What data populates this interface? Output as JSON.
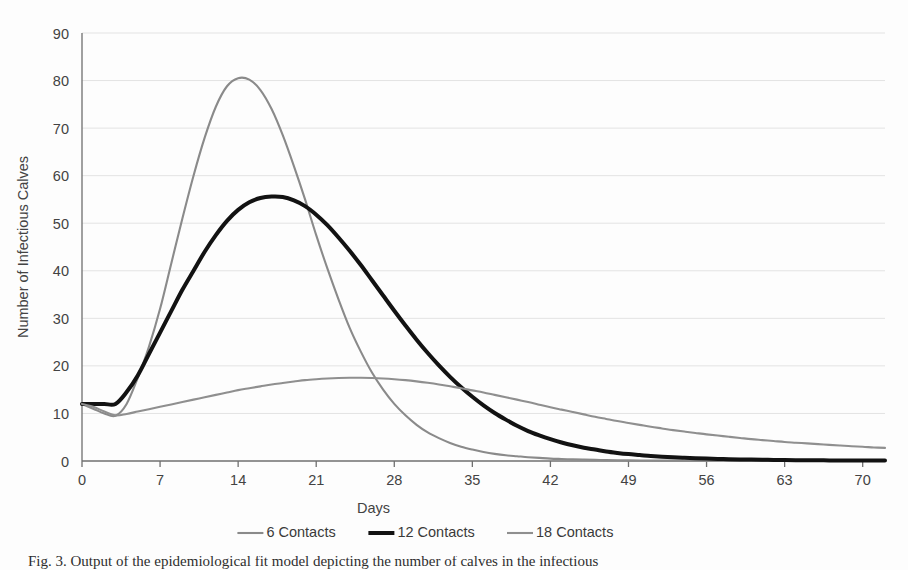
{
  "figure": {
    "caption_partial": "Fig. 3. Output of the epidemiological fit model depicting the number of calves in the infectious"
  },
  "chart_data": {
    "type": "line",
    "title": "",
    "xlabel": "Days",
    "ylabel": "Number of Infectious Calves",
    "xlim": [
      0,
      72
    ],
    "ylim": [
      0,
      90
    ],
    "xticks": [
      0,
      7,
      14,
      21,
      28,
      35,
      42,
      49,
      56,
      63,
      70
    ],
    "yticks": [
      0,
      10,
      20,
      30,
      40,
      50,
      60,
      70,
      80,
      90
    ],
    "grid": "horizontal",
    "legend_position": "bottom",
    "x": [
      0,
      1,
      2,
      3,
      4,
      5,
      6,
      7,
      8,
      9,
      10,
      11,
      12,
      13,
      14,
      15,
      16,
      17,
      18,
      19,
      20,
      21,
      22,
      23,
      24,
      25,
      26,
      27,
      28,
      29,
      30,
      31,
      32,
      33,
      34,
      35,
      36,
      37,
      38,
      39,
      40,
      41,
      42,
      43,
      44,
      45,
      46,
      47,
      48,
      49,
      50,
      51,
      52,
      53,
      54,
      55,
      56,
      57,
      58,
      59,
      60,
      61,
      62,
      63,
      64,
      65,
      66,
      67,
      68,
      69,
      70,
      71,
      72
    ],
    "series": [
      {
        "name": "6 Contacts",
        "color": "#8a8a8a",
        "width": 2.1,
        "values": [
          12.0,
          11.0,
          10.0,
          9.5,
          12.0,
          17.5,
          24.0,
          32.0,
          41.5,
          51.0,
          60.0,
          68.0,
          74.5,
          78.8,
          80.5,
          80.2,
          78.0,
          74.0,
          68.5,
          62.0,
          55.0,
          47.5,
          40.5,
          34.0,
          28.0,
          23.0,
          18.6,
          15.0,
          12.0,
          9.6,
          7.6,
          6.0,
          4.8,
          3.8,
          3.0,
          2.4,
          1.9,
          1.5,
          1.2,
          1.0,
          0.8,
          0.65,
          0.5,
          0.42,
          0.34,
          0.28,
          0.23,
          0.19,
          0.16,
          0.13,
          0.11,
          0.09,
          0.08,
          0.07,
          0.06,
          0.05,
          0.045,
          0.04,
          0.035,
          0.03,
          0.028,
          0.025,
          0.022,
          0.02,
          0.018,
          0.016,
          0.015,
          0.014,
          0.013,
          0.012,
          0.011,
          0.01,
          0.01
        ]
      },
      {
        "name": "12 Contacts",
        "color": "#121212",
        "width": 4.0,
        "values": [
          12.0,
          12.0,
          12.0,
          12.0,
          14.5,
          18.0,
          22.5,
          27.0,
          31.5,
          36.0,
          40.0,
          44.0,
          47.5,
          50.5,
          52.8,
          54.4,
          55.3,
          55.6,
          55.5,
          54.8,
          53.6,
          51.8,
          49.6,
          47.0,
          44.2,
          41.2,
          38.0,
          34.8,
          31.6,
          28.5,
          25.5,
          22.7,
          20.1,
          17.7,
          15.5,
          13.5,
          11.7,
          10.1,
          8.7,
          7.4,
          6.3,
          5.4,
          4.6,
          3.9,
          3.3,
          2.8,
          2.4,
          2.0,
          1.7,
          1.45,
          1.25,
          1.05,
          0.9,
          0.78,
          0.67,
          0.58,
          0.5,
          0.44,
          0.38,
          0.33,
          0.29,
          0.26,
          0.23,
          0.2,
          0.18,
          0.16,
          0.15,
          0.13,
          0.12,
          0.11,
          0.1,
          0.1,
          0.1
        ]
      },
      {
        "name": "18 Contacts",
        "color": "#8f8f8f",
        "width": 2.1,
        "values": [
          12.0,
          11.4,
          10.4,
          9.6,
          9.9,
          10.4,
          10.9,
          11.4,
          11.9,
          12.4,
          12.9,
          13.4,
          13.9,
          14.4,
          14.9,
          15.3,
          15.7,
          16.1,
          16.4,
          16.7,
          17.0,
          17.2,
          17.35,
          17.45,
          17.5,
          17.5,
          17.45,
          17.35,
          17.2,
          17.0,
          16.75,
          16.45,
          16.1,
          15.7,
          15.3,
          14.85,
          14.4,
          13.9,
          13.4,
          12.9,
          12.4,
          11.85,
          11.3,
          10.8,
          10.3,
          9.8,
          9.3,
          8.85,
          8.4,
          8.0,
          7.6,
          7.2,
          6.85,
          6.5,
          6.2,
          5.9,
          5.6,
          5.35,
          5.1,
          4.85,
          4.6,
          4.4,
          4.2,
          4.0,
          3.85,
          3.7,
          3.55,
          3.4,
          3.25,
          3.1,
          3.0,
          2.85,
          2.75
        ]
      }
    ]
  }
}
